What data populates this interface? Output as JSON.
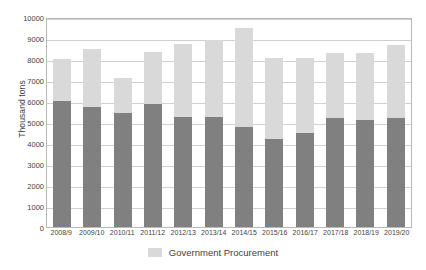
{
  "chart_data": {
    "type": "bar",
    "title": "",
    "xlabel": "",
    "ylabel": "Thousand tons",
    "ylim": [
      0,
      10000
    ],
    "ytick_step": 1000,
    "yticks": [
      "0",
      "1000",
      "2000",
      "3000",
      "4000",
      "5000",
      "6000",
      "7000",
      "8000",
      "9000",
      "10000"
    ],
    "grid": true,
    "stacked": true,
    "legend_position": "bottom-center",
    "legend": [
      "Government Procurement"
    ],
    "categories": [
      "2008/9",
      "2009/10",
      "2010/11",
      "2011/12",
      "2012/13",
      "2013/14",
      "2014/15",
      "2015/16",
      "2016/17",
      "2017/18",
      "2018/19",
      "2019/20"
    ],
    "series": [
      {
        "name": "Government Procurement",
        "color": "#d9d9d9",
        "values": [
          2000,
          2800,
          1650,
          2500,
          3450,
          3650,
          4750,
          3850,
          3550,
          3100,
          3200,
          3450
        ]
      },
      {
        "name": "Lower segment",
        "color": "#808080",
        "values": [
          6000,
          5700,
          5450,
          5850,
          5250,
          5250,
          4750,
          4200,
          4500,
          5200,
          5100,
          5200
        ]
      }
    ],
    "totals": [
      8000,
      8500,
      7100,
      8350,
      8700,
      8900,
      9500,
      8050,
      8050,
      8300,
      8300,
      8650
    ]
  },
  "colors": {
    "procurement": "#d9d9d9",
    "other": "#808080",
    "grid": "#d0d0d0",
    "axis": "#b8b8b8",
    "text": "#3f3f3f"
  }
}
